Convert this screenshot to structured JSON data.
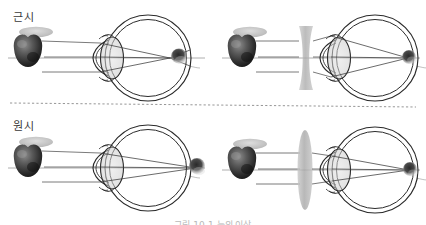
{
  "figure": {
    "title_myopia": "근시",
    "title_hyperopia": "원시",
    "caption": "그림 10-1  눈의 이상",
    "background_color": "#ffffff",
    "ink_color": "#2b2b2b",
    "ray_color": "#555555",
    "lens_fill": "#b3b3b3",
    "divider": {
      "style": "dashed",
      "color": "#8a8a8a"
    }
  },
  "panels": [
    {
      "id": "myopia-uncorrected",
      "label": "근시",
      "condition": "myopia",
      "corrective_lens": "none",
      "object": "apple",
      "focus_location": "in front of retina",
      "blur_spot": "inside vitreous",
      "ray_count": 3
    },
    {
      "id": "myopia-corrected",
      "label": "",
      "condition": "myopia",
      "corrective_lens": "biconcave",
      "object": "apple",
      "focus_location": "on retina",
      "blur_spot": "at retina",
      "ray_count": 3
    },
    {
      "id": "hyperopia-uncorrected",
      "label": "원시",
      "condition": "hyperopia",
      "corrective_lens": "none",
      "object": "apple",
      "focus_location": "behind retina",
      "blur_spot": "outside eye",
      "ray_count": 3
    },
    {
      "id": "hyperopia-corrected",
      "label": "",
      "condition": "hyperopia",
      "corrective_lens": "biconvex",
      "object": "apple",
      "focus_location": "on retina",
      "blur_spot": "at retina",
      "ray_count": 3
    }
  ]
}
